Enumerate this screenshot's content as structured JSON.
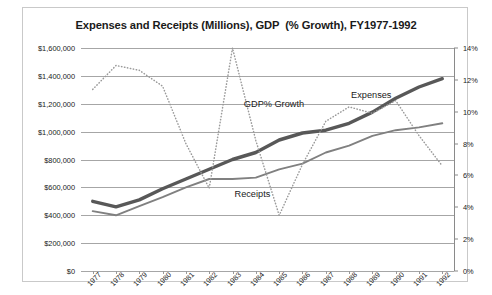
{
  "chart_data": {
    "type": "line",
    "title": "Expenses and Receipts (Millions), GDP  (% Growth), FY1977-1992",
    "xlabel": "",
    "ylabel": "",
    "y2label": "",
    "grid": true,
    "legend_position": "inline-annotations",
    "categories": [
      "1977",
      "1978",
      "1979",
      "1980",
      "1981",
      "1982",
      "1983",
      "1984",
      "1985",
      "1986",
      "1987",
      "1988",
      "1989",
      "1990",
      "1991",
      "1992"
    ],
    "ylim": [
      0,
      1600000
    ],
    "yticks": [
      0,
      200000,
      400000,
      600000,
      800000,
      1000000,
      1200000,
      1400000,
      1600000
    ],
    "ytick_labels": [
      "$0",
      "$200,000",
      "$400,000",
      "$600,000",
      "$800,000",
      "$1,000,000",
      "$1,200,000",
      "$1,400,000",
      "$1,600,000"
    ],
    "y2lim": [
      0,
      14
    ],
    "y2ticks": [
      0,
      2,
      4,
      6,
      8,
      10,
      12,
      14
    ],
    "y2tick_labels": [
      "0%",
      "2%",
      "4%",
      "6%",
      "8%",
      "10%",
      "12%",
      "14%"
    ],
    "series": [
      {
        "name": "Expenses",
        "axis": "left",
        "style": "solid-thick",
        "color": "#585858",
        "values": [
          500000,
          460000,
          510000,
          590000,
          660000,
          730000,
          800000,
          850000,
          940000,
          990000,
          1010000,
          1060000,
          1140000,
          1240000,
          1320000,
          1380000
        ]
      },
      {
        "name": "Receipts",
        "axis": "left",
        "style": "solid-thin",
        "color": "#808080",
        "values": [
          430000,
          400000,
          465000,
          530000,
          600000,
          660000,
          660000,
          670000,
          730000,
          770000,
          850000,
          900000,
          970000,
          1010000,
          1030000,
          1060000
        ]
      },
      {
        "name": "GDP% Growth",
        "axis": "right",
        "style": "dotted",
        "color": "#9a9a9a",
        "values": [
          11.4,
          12.9,
          12.6,
          11.6,
          8.0,
          5.2,
          14.0,
          8.2,
          3.5,
          6.7,
          9.4,
          10.3,
          9.9,
          10.7,
          8.5,
          6.6
        ]
      }
    ],
    "annotations": [
      {
        "name": "expenses-label",
        "text": "Expenses"
      },
      {
        "name": "receipts-label",
        "text": "Receipts"
      },
      {
        "name": "gdp-growth-label",
        "text": "GDP% Growth"
      }
    ]
  }
}
